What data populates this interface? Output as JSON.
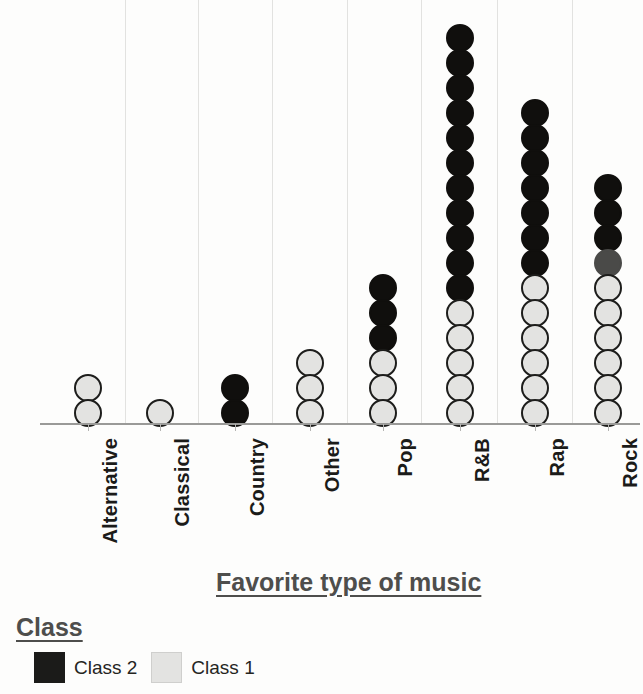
{
  "chart_data": {
    "type": "dot-plot",
    "title": "Favorite type of music",
    "xlabel": "Favorite type of music",
    "ylabel": "",
    "grid": "vertical",
    "legend_position": "bottom-left",
    "legend_title": "Class",
    "categories": [
      "Alternative",
      "Classical",
      "Country",
      "Other",
      "Pop",
      "R&B",
      "Rap",
      "Rock"
    ],
    "series": [
      {
        "name": "Class 1",
        "color": "#e3e3e1",
        "values": [
          2,
          1,
          0,
          3,
          3,
          5,
          6,
          6
        ]
      },
      {
        "name": "Class 2",
        "color": "#100f0d",
        "values": [
          0,
          0,
          2,
          0,
          3,
          11,
          7,
          4
        ]
      }
    ],
    "totals": [
      2,
      1,
      2,
      3,
      6,
      16,
      13,
      10
    ],
    "dot_value": 1,
    "columns": [
      {
        "category": "Alternative",
        "x": 88,
        "dots": [
          "class1",
          "class1"
        ]
      },
      {
        "category": "Classical",
        "x": 160,
        "dots": [
          "class1"
        ]
      },
      {
        "category": "Country",
        "x": 235,
        "dots": [
          "class2",
          "class2"
        ]
      },
      {
        "category": "Other",
        "x": 310,
        "dots": [
          "class1",
          "class1",
          "class1"
        ]
      },
      {
        "category": "Pop",
        "x": 383,
        "dots": [
          "class1",
          "class1",
          "class1",
          "class2",
          "class2",
          "class2"
        ]
      },
      {
        "category": "R&B",
        "x": 460,
        "dots": [
          "class1",
          "class1",
          "class1",
          "class1",
          "class1",
          "class2",
          "class2",
          "class2",
          "class2",
          "class2",
          "class2",
          "class2",
          "class2",
          "class2",
          "class2",
          "class2"
        ]
      },
      {
        "category": "Rap",
        "x": 535,
        "dots": [
          "class1",
          "class1",
          "class1",
          "class1",
          "class1",
          "class1",
          "class2",
          "class2",
          "class2",
          "class2",
          "class2",
          "class2",
          "class2"
        ]
      },
      {
        "category": "Rock",
        "x": 608,
        "dots": [
          "class1",
          "class1",
          "class1",
          "class1",
          "class1",
          "class1",
          "class2-faded",
          "class2",
          "class2",
          "class2"
        ]
      }
    ],
    "gridlines_x": [
      125,
      198,
      272,
      347,
      421,
      497,
      572
    ],
    "axis_ticks_x": [
      88,
      160,
      235,
      310,
      383,
      460,
      535,
      608
    ]
  },
  "axis": {
    "title": "Favorite type of music"
  },
  "legend": {
    "title": "Class",
    "items": [
      {
        "label": "Class 2",
        "swatch": "class2"
      },
      {
        "label": "Class 1",
        "swatch": "class1"
      }
    ]
  }
}
